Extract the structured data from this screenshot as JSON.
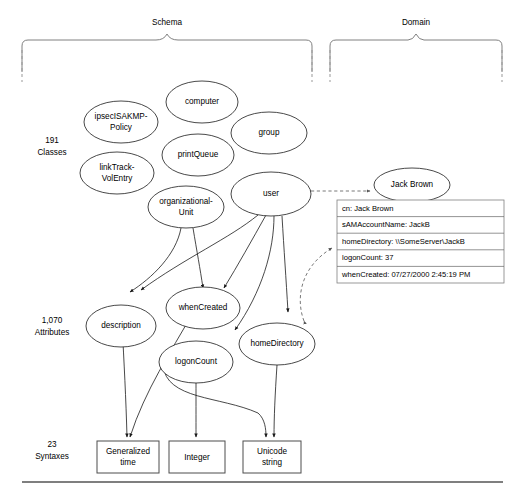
{
  "figure": {
    "braces": [
      {
        "id": "schema",
        "label": "Schema"
      },
      {
        "id": "domain",
        "label": "Domain"
      }
    ],
    "row_labels": [
      {
        "id": "classes",
        "count": "191",
        "name": "Classes"
      },
      {
        "id": "attributes",
        "count": "1,070",
        "name": "Attributes"
      },
      {
        "id": "syntaxes",
        "count": "23",
        "name": "Syntaxes"
      }
    ],
    "class_nodes": [
      {
        "id": "ipsecisakmp-policy",
        "line1": "ipsecISAKMP-",
        "line2": "Policy"
      },
      {
        "id": "computer",
        "line1": "computer",
        "line2": ""
      },
      {
        "id": "group",
        "line1": "group",
        "line2": ""
      },
      {
        "id": "printqueue",
        "line1": "printQueue",
        "line2": ""
      },
      {
        "id": "linktrack-volentry",
        "line1": "linkTrack-",
        "line2": "VolEntry"
      },
      {
        "id": "organizational-unit",
        "line1": "organizational-",
        "line2": "Unit"
      },
      {
        "id": "user",
        "line1": "user",
        "line2": ""
      }
    ],
    "domain_nodes": [
      {
        "id": "jack-brown",
        "line1": "Jack Brown",
        "line2": ""
      }
    ],
    "attribute_nodes": [
      {
        "id": "description",
        "line1": "description",
        "line2": ""
      },
      {
        "id": "whencreated",
        "line1": "whenCreated",
        "line2": ""
      },
      {
        "id": "logoncount",
        "line1": "logonCount",
        "line2": ""
      },
      {
        "id": "homedirectory",
        "line1": "homeDirectory",
        "line2": ""
      }
    ],
    "syntax_nodes": [
      {
        "id": "generalized-time",
        "line1": "Generalized",
        "line2": "time"
      },
      {
        "id": "integer",
        "line1": "Integer",
        "line2": ""
      },
      {
        "id": "unicode-string",
        "line1": "Unicode",
        "line2": "string"
      }
    ],
    "object_table": {
      "id": "jack-brown-attributes",
      "rows": [
        {
          "id": "cn",
          "text": "cn: Jack Brown"
        },
        {
          "id": "samaccountname",
          "text": "sAMAccountName: JackB"
        },
        {
          "id": "homedirectory",
          "text": "homeDirectory: \\\\SomeServer\\JackB"
        },
        {
          "id": "logoncount",
          "text": "logonCount: 37"
        },
        {
          "id": "whencreated",
          "text": "whenCreated: 07/27/2000 2:45:19 PM"
        }
      ]
    },
    "colors": {
      "stroke": "#1a1a1a",
      "dashed_stroke": "#555555",
      "brace_stroke": "#808080",
      "box_stroke": "#4d4d4d",
      "background": "#ffffff"
    }
  }
}
